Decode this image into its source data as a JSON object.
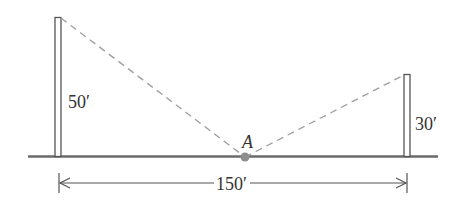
{
  "diagram": {
    "type": "geometry-word-problem",
    "left_pole": {
      "height_label": "50′",
      "height_ft": 50
    },
    "right_pole": {
      "height_label": "30′",
      "height_ft": 30
    },
    "point": {
      "label": "A"
    },
    "distance": {
      "label": "150′",
      "distance_ft": 150
    },
    "colors": {
      "line": "#555555",
      "dashed": "#999999",
      "point": "#8a8a8a",
      "text": "#333333",
      "background": "#ffffff"
    }
  }
}
